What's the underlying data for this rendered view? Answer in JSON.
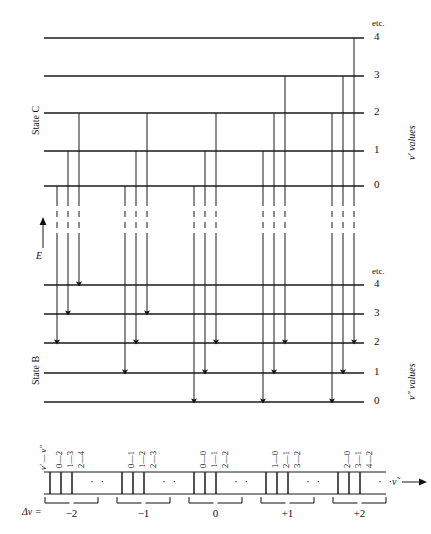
{
  "figure": {
    "type": "energy-level-transition-diagram",
    "upper_state": {
      "name": "State C",
      "quantum_label": "v′ values",
      "etc": "etc.",
      "levels": [
        {
          "v": "4",
          "y": 38
        },
        {
          "v": "3",
          "y": 76
        },
        {
          "v": "2",
          "y": 113
        },
        {
          "v": "1",
          "y": 151
        },
        {
          "v": "0",
          "y": 186
        }
      ]
    },
    "lower_state": {
      "name": "State B",
      "quantum_label": "v″ values",
      "etc": "etc.",
      "levels": [
        {
          "v": "4",
          "y": 285
        },
        {
          "v": "3",
          "y": 314
        },
        {
          "v": "2",
          "y": 343
        },
        {
          "v": "1",
          "y": 373
        },
        {
          "v": "0",
          "y": 402
        }
      ]
    },
    "energy_axis": {
      "label": "E",
      "arrow": "↑"
    },
    "level_line": {
      "x_start": 44,
      "x_end": 364
    },
    "transitions": [
      {
        "x": 57,
        "from_y": 186,
        "to_y": 343
      },
      {
        "x": 68,
        "from_y": 151,
        "to_y": 314
      },
      {
        "x": 79,
        "from_y": 113,
        "to_y": 285
      },
      {
        "x": 125,
        "from_y": 186,
        "to_y": 373
      },
      {
        "x": 136,
        "from_y": 151,
        "to_y": 343
      },
      {
        "x": 147,
        "from_y": 113,
        "to_y": 314
      },
      {
        "x": 194,
        "from_y": 186,
        "to_y": 402
      },
      {
        "x": 205,
        "from_y": 151,
        "to_y": 373
      },
      {
        "x": 216,
        "from_y": 113,
        "to_y": 343
      },
      {
        "x": 263,
        "from_y": 151,
        "to_y": 402
      },
      {
        "x": 274,
        "from_y": 113,
        "to_y": 373
      },
      {
        "x": 285,
        "from_y": 76,
        "to_y": 343
      },
      {
        "x": 332,
        "from_y": 113,
        "to_y": 402
      },
      {
        "x": 343,
        "from_y": 76,
        "to_y": 373
      },
      {
        "x": 354,
        "from_y": 38,
        "to_y": 343
      }
    ],
    "break_zone": {
      "y_top": 200,
      "y_bottom": 238
    }
  },
  "spectrum": {
    "row_label": "v′ — v″",
    "delta_label": "Δv =",
    "axis_label": "ν̃",
    "axis_arrow": "→",
    "dots": "· ·",
    "baseline_top_y": 472,
    "baseline_bottom_y": 494,
    "groups": [
      {
        "delta": "−2",
        "center_x": 72,
        "lines_x": [
          50,
          61,
          72
        ],
        "dots_x": 90,
        "brace_x1": 45,
        "brace_x2": 98,
        "bands": [
          {
            "label": "0—2",
            "x": 50
          },
          {
            "label": "1—3",
            "x": 61
          },
          {
            "label": "2—4",
            "x": 72
          }
        ]
      },
      {
        "delta": "−1",
        "center_x": 144,
        "lines_x": [
          122,
          133,
          144
        ],
        "dots_x": 162,
        "brace_x1": 117,
        "brace_x2": 170,
        "bands": [
          {
            "label": "0—1",
            "x": 122
          },
          {
            "label": "1—2",
            "x": 133
          },
          {
            "label": "2—3",
            "x": 144
          }
        ]
      },
      {
        "delta": "0",
        "center_x": 216,
        "lines_x": [
          194,
          205,
          216
        ],
        "dots_x": 234,
        "brace_x1": 189,
        "brace_x2": 242,
        "bands": [
          {
            "label": "0—0",
            "x": 194
          },
          {
            "label": "1—1",
            "x": 205
          },
          {
            "label": "2—2",
            "x": 216
          }
        ]
      },
      {
        "delta": "+1",
        "center_x": 288,
        "lines_x": [
          266,
          277,
          288
        ],
        "dots_x": 306,
        "brace_x1": 261,
        "brace_x2": 314,
        "bands": [
          {
            "label": "1—0",
            "x": 266
          },
          {
            "label": "2—1",
            "x": 277
          },
          {
            "label": "3—2",
            "x": 288
          }
        ]
      },
      {
        "delta": "+2",
        "center_x": 360,
        "lines_x": [
          338,
          349,
          360
        ],
        "dots_x": 378,
        "brace_x1": 333,
        "brace_x2": 386,
        "bands": [
          {
            "label": "2—0",
            "x": 338
          },
          {
            "label": "3—1",
            "x": 349
          },
          {
            "label": "4—2",
            "x": 360
          }
        ]
      }
    ]
  },
  "colors": {
    "ink": "#111111",
    "line": "#1a1a1a"
  }
}
